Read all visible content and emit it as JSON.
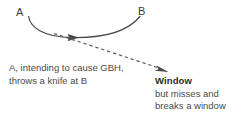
{
  "diagram": {
    "type": "flow-diagram",
    "colors": {
      "background": "#ffffff",
      "stroke": "#4a4a4a",
      "text": "#4a4a4a",
      "text_bold": "#2b2b2b",
      "node_label": "#3a3a3a"
    },
    "nodes": [
      {
        "id": "a",
        "label": "A"
      },
      {
        "id": "b",
        "label": "B"
      }
    ],
    "edges": [
      {
        "id": "intended-throw",
        "style": "solid",
        "from": "a",
        "to": "b",
        "arrow": "mid-right",
        "shape": "downward-curve"
      },
      {
        "id": "actual-trajectory",
        "style": "dashed",
        "from": "a",
        "to": "window",
        "arrow": "end",
        "shape": "straight-diagonal"
      }
    ],
    "captions": {
      "left": {
        "lines": [
          "A, intending to cause GBH,",
          "throws a knife at B"
        ],
        "line1": "A, intending to cause GBH,",
        "line2": "throws a knife at B"
      },
      "right": {
        "heading": "Window",
        "lines": [
          "but misses and",
          "breaks a window"
        ],
        "line1": "but misses and",
        "line2": "breaks a window"
      }
    }
  }
}
